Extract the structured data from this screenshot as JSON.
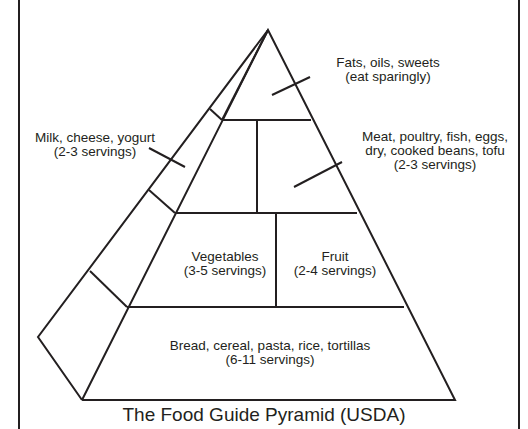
{
  "title": "The Food Guide Pyramid (USDA)",
  "groups": {
    "fats": {
      "name": "Fats, oils, sweets",
      "servings": "(eat sparingly)"
    },
    "milk": {
      "name": "Milk, cheese, yogurt",
      "servings": "(2-3 servings)"
    },
    "meat": {
      "line1": "Meat, poultry, fish, eggs,",
      "line2": "dry, cooked beans, tofu",
      "servings": "(2-3 servings)"
    },
    "vegetables": {
      "name": "Vegetables",
      "servings": "(3-5 servings)"
    },
    "fruit": {
      "name": "Fruit",
      "servings": "(2-4 servings)"
    },
    "bread": {
      "name": "Bread, cereal, pasta, rice, tortillas",
      "servings": "(6-11 servings)"
    }
  },
  "colors": {
    "ink": "#231f20",
    "background": "#ffffff"
  }
}
